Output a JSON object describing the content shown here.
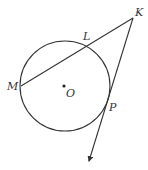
{
  "diagram": {
    "type": "geometry-circle-secant-tangent",
    "colors": {
      "stroke": "#333333",
      "background": "#ffffff"
    },
    "circle": {
      "center_label": "O",
      "cx": 65,
      "cy": 86,
      "r": 45
    },
    "points": {
      "M": {
        "label": "M",
        "x": 21,
        "y": 86
      },
      "L": {
        "label": "L",
        "x": 87,
        "y": 46
      },
      "K": {
        "label": "K",
        "x": 133,
        "y": 18
      },
      "P": {
        "label": "P",
        "x": 107,
        "y": 107
      },
      "O": {
        "label": "O",
        "x": 65,
        "y": 86
      }
    },
    "segments": [
      {
        "name": "secant-KM",
        "from": "K",
        "to": "M"
      },
      {
        "name": "tangent-ray-KP",
        "from": "K",
        "through": "P",
        "arrow": true
      }
    ]
  }
}
